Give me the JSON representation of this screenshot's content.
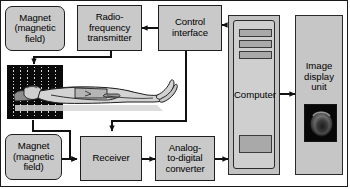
{
  "diagram": {
    "background_color": "#ffffff",
    "box_fill_color": "#c9c9c9",
    "line_color": "#1a1a1a"
  },
  "nodes": {
    "magnet_top": {
      "label": "Magnet\n(magnetic\nfield)",
      "line1": "Magnet",
      "line2": "(magnetic",
      "line3": "field)"
    },
    "rf_transmitter": {
      "line1": "Radio-",
      "line2": "frequency",
      "line3": "transmitter"
    },
    "control_interface": {
      "line1": "Control",
      "line2": "interface"
    },
    "computer": {
      "label": "Computer"
    },
    "image_display": {
      "line1": "Image",
      "line2": "display",
      "line3": "unit"
    },
    "magnet_bottom": {
      "line1": "Magnet",
      "line2": "(magnetic",
      "line3": "field)"
    },
    "receiver": {
      "label": "Receiver"
    },
    "adc": {
      "line1": "Analog-",
      "line2": "to-digital",
      "line3": "converter"
    }
  },
  "illustration": {
    "scanner": {
      "name": "patient-in-scanner-illustration"
    },
    "scan_image": {
      "name": "brain-scan-image"
    }
  },
  "connections": [
    {
      "from": "rf_transmitter",
      "to": "scanner",
      "type": "arrow-down-left"
    },
    {
      "from": "control_interface",
      "to": "rf_transmitter",
      "type": "arrow-left"
    },
    {
      "from": "computer",
      "to": "control_interface",
      "type": "arrow-left"
    },
    {
      "from": "control_interface",
      "to": "receiver",
      "type": "arrow-down"
    },
    {
      "from": "scanner",
      "to": "receiver",
      "type": "arrow-down-right"
    },
    {
      "from": "magnet_bottom",
      "to": "receiver",
      "type": "arrow-right"
    },
    {
      "from": "receiver",
      "to": "adc",
      "type": "arrow-right"
    },
    {
      "from": "adc",
      "to": "computer",
      "type": "arrow-right"
    },
    {
      "from": "computer",
      "to": "image_display",
      "type": "arrow-right"
    }
  ]
}
